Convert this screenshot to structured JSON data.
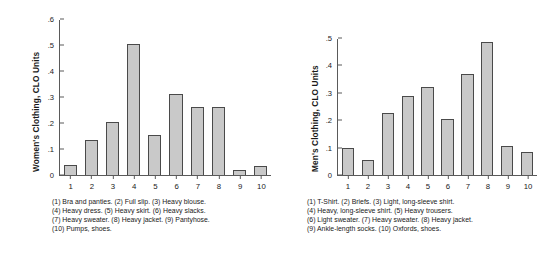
{
  "chart_data": [
    {
      "type": "bar",
      "title": "",
      "xlabel": "",
      "ylabel": "Women's Clothing, CLO Units",
      "ylim": [
        0,
        0.6
      ],
      "yticks": [
        0,
        0.1,
        0.2,
        0.3,
        0.4,
        0.5,
        0.6
      ],
      "ytick_labels": [
        "0",
        ".1",
        ".2",
        ".3",
        ".4",
        ".5",
        ".6"
      ],
      "categories": [
        "1",
        "2",
        "3",
        "4",
        "5",
        "6",
        "7",
        "8",
        "9",
        "10"
      ],
      "values": [
        0.04,
        0.135,
        0.205,
        0.505,
        0.155,
        0.31,
        0.26,
        0.26,
        0.02,
        0.035
      ],
      "grid": false,
      "legend": "none",
      "bar_fill": "#c9c9c9",
      "bar_edge": "#4a4a4a",
      "annotations": [
        "(1) Bra and panties. (2) Full slip. (3) Heavy blouse.",
        "(4) Heavy dress. (5) Heavy skirt. (6) Heavy slacks.",
        "(7) Heavy sweater. (8) Heavy jacket. (9) Pantyhose.",
        "(10) Pumps, shoes."
      ]
    },
    {
      "type": "bar",
      "title": "",
      "xlabel": "",
      "ylabel": "Men's Clothing, CLO Units",
      "ylim": [
        0,
        0.5
      ],
      "yticks": [
        0,
        0.1,
        0.2,
        0.3,
        0.4,
        0.5
      ],
      "ytick_labels": [
        "0",
        ".1",
        ".2",
        ".3",
        ".4",
        ".5"
      ],
      "categories": [
        "1",
        "2",
        "3",
        "4",
        "5",
        "6",
        "7",
        "8",
        "9",
        "10"
      ],
      "values": [
        0.1,
        0.055,
        0.225,
        0.29,
        0.32,
        0.205,
        0.37,
        0.485,
        0.105,
        0.085
      ],
      "grid": false,
      "legend": "none",
      "bar_fill": "#c9c9c9",
      "bar_edge": "#4a4a4a",
      "annotations": [
        "(1) T-Shirt. (2) Briefs. (3) Light, long-sleeve shirt.",
        "(4) Heavy, long-sleeve shirt. (5) Heavy trousers.",
        "(6) Light sweater.  (7) Heavy sweater. (8) Heavy jacket.",
        "(9) Ankle-length socks. (10) Oxfords, shoes."
      ]
    }
  ]
}
